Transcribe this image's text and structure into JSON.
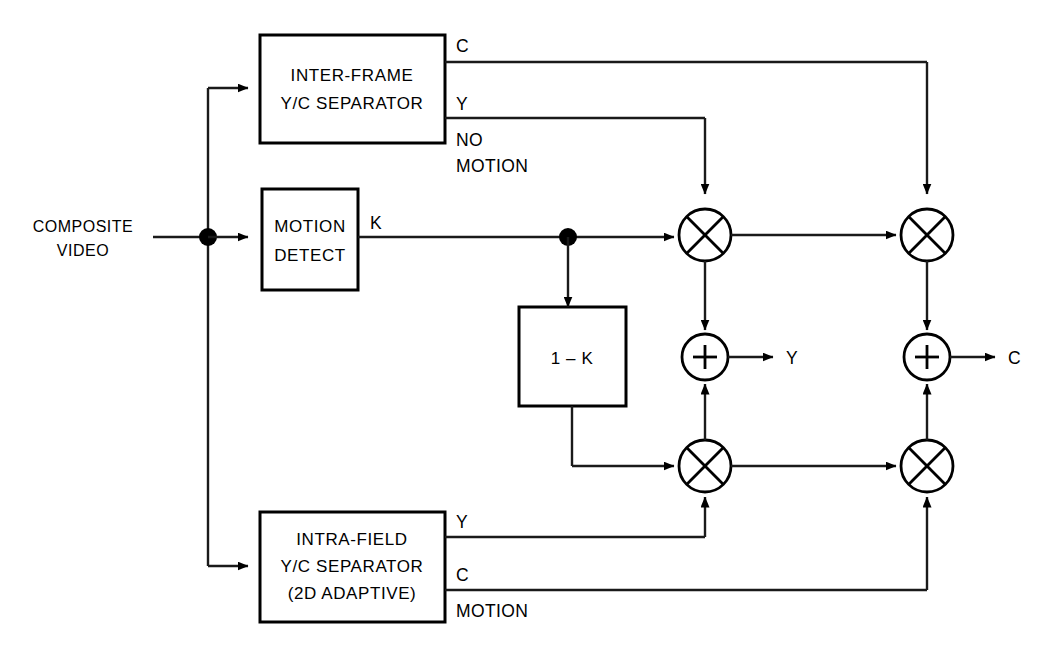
{
  "diagram": {
    "type": "block-diagram",
    "background_color": "#ffffff",
    "line_color": "#1a1a1a",
    "text_color": "#000000"
  },
  "source": {
    "label_line1": "COMPOSITE",
    "label_line2": "VIDEO"
  },
  "blocks": {
    "inter_frame": {
      "line1": "INTER-FRAME",
      "line2": "Y/C  SEPARATOR"
    },
    "motion_detect": {
      "line1": "MOTION",
      "line2": "DETECT"
    },
    "intra_field": {
      "line1": "INTRA-FIELD",
      "line2": "Y/C  SEPARATOR",
      "line3": "(2D  ADAPTIVE)"
    },
    "one_minus_k": {
      "label": "1 – K"
    }
  },
  "signal_labels": {
    "inter_c": "C",
    "inter_y": "Y",
    "no_motion_line1": "NO",
    "no_motion_line2": "MOTION",
    "k": "K",
    "intra_y": "Y",
    "intra_c": "C",
    "motion": "MOTION",
    "out_y": "Y",
    "out_c": "C"
  },
  "operators": {
    "multiply_symbol": "⊗",
    "add_symbol": "+",
    "mult_top_left": "multiplier",
    "mult_top_right": "multiplier",
    "mult_bottom_left": "multiplier",
    "mult_bottom_right": "multiplier",
    "adder_left": "adder",
    "adder_right": "adder"
  }
}
